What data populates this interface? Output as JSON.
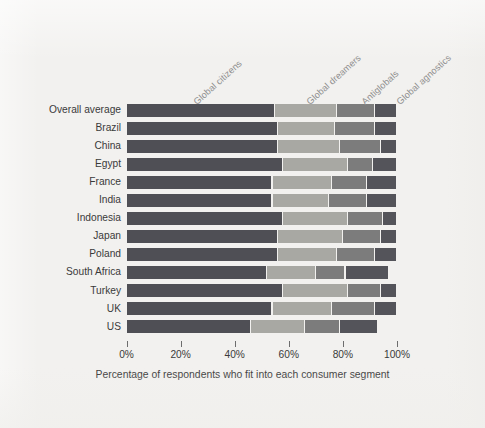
{
  "figure": {
    "background_color": "#f2f1ef",
    "axis_title": "Percentage of respondents who fit into each consumer segment"
  },
  "chart_data": {
    "type": "bar",
    "orientation": "horizontal",
    "stacked": true,
    "title": "",
    "subtitle": "",
    "xlabel": "Percentage of respondents who fit into each consumer segment",
    "ylabel": "",
    "xlim": [
      0,
      100
    ],
    "xticks": [
      0,
      20,
      40,
      60,
      80,
      100
    ],
    "xtick_labels": [
      "0%",
      "20%",
      "40%",
      "60%",
      "80%",
      "100%"
    ],
    "grid": false,
    "legend_position": "top-rotated-inline",
    "value_unit": "%",
    "categories": [
      "Overall average",
      "Brazil",
      "China",
      "Egypt",
      "France",
      "India",
      "Indonesia",
      "Japan",
      "Poland",
      "South Africa",
      "Turkey",
      "UK",
      "US"
    ],
    "series": [
      {
        "name": "Global citizens",
        "color": "#4f4f55",
        "values": [
          55,
          56,
          56,
          58,
          54,
          54,
          58,
          56,
          56,
          52,
          58,
          54,
          46
        ]
      },
      {
        "name": "Global dreamers",
        "color": "#a8a8a3",
        "values": [
          23,
          21,
          23,
          24,
          22,
          21,
          24,
          24,
          22,
          18,
          24,
          22,
          20
        ]
      },
      {
        "name": "Antiglobals",
        "color": "#7c7c7c",
        "values": [
          14,
          15,
          15,
          9,
          13,
          14,
          13,
          14,
          14,
          11,
          12,
          16,
          13
        ]
      },
      {
        "name": "Global agnostics",
        "color": "#54545a",
        "values": [
          8,
          8,
          6,
          9,
          11,
          11,
          5,
          6,
          8,
          16,
          6,
          8,
          14
        ]
      }
    ],
    "row_totals": [
      100,
      100,
      100,
      100,
      100,
      100,
      100,
      100,
      100,
      97,
      100,
      100,
      93
    ],
    "annotations": [
      {
        "label": "Global citizens",
        "series": "Global citizens"
      },
      {
        "label": "Global dreamers",
        "series": "Global dreamers"
      },
      {
        "label": "Antiglobals",
        "series": "Antiglobals"
      },
      {
        "label": "Global agnostics",
        "series": "Global agnostics"
      }
    ]
  }
}
